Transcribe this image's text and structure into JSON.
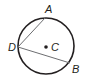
{
  "diagram": {
    "type": "circle-with-inscribed-angle",
    "circle": {
      "center_label": "C",
      "cx": 46,
      "cy": 46,
      "r": 28
    },
    "points": [
      {
        "label": "A",
        "x": 45,
        "y": 18,
        "label_x": 45,
        "label_y": 13
      },
      {
        "label": "D",
        "x": 18,
        "y": 47,
        "label_x": 8,
        "label_y": 51
      },
      {
        "label": "B",
        "x": 70,
        "y": 63,
        "label_x": 72,
        "label_y": 73
      }
    ],
    "center_label_pos": {
      "x": 51,
      "y": 51
    },
    "segments": [
      {
        "from": "D",
        "to": "A"
      },
      {
        "from": "D",
        "to": "B"
      }
    ],
    "colors": {
      "stroke": "#231f20",
      "chord": "#6d6e71"
    }
  }
}
